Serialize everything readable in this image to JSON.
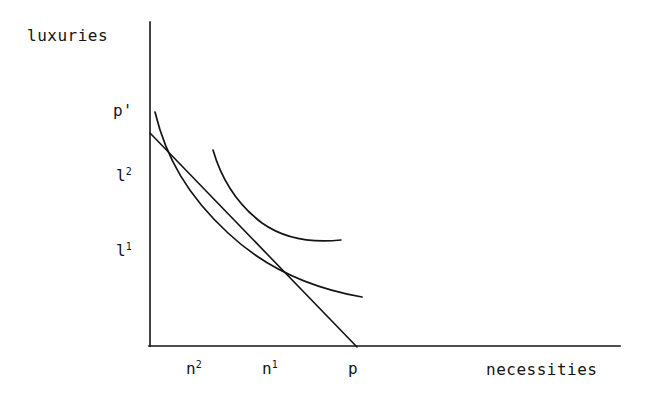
{
  "figure": {
    "title": "",
    "background_color": "#ffffff",
    "ink_color": "#141414"
  },
  "axes": {
    "y_axis_title": "luxuries",
    "x_axis_title": "necessities",
    "origin": {
      "x": 150,
      "y": 346
    },
    "y_axis_top": {
      "x": 150,
      "y": 22
    },
    "x_axis_right": {
      "x": 620,
      "y": 346
    }
  },
  "tick_labels": {
    "y": [
      {
        "name": "p-prime",
        "text": "p'",
        "x": 113,
        "y": 101
      },
      {
        "name": "l2",
        "base": "l",
        "sup": "2",
        "x": 116,
        "y": 166
      },
      {
        "name": "l1",
        "base": "l",
        "sup": "1",
        "x": 116,
        "y": 241
      }
    ],
    "x": [
      {
        "name": "n2",
        "base": "n",
        "sup": "2",
        "x": 186,
        "y": 359
      },
      {
        "name": "n1",
        "base": "n",
        "sup": "1",
        "x": 262,
        "y": 359
      },
      {
        "name": "p",
        "text": "p",
        "x": 348,
        "y": 359
      }
    ]
  },
  "chart_data": {
    "type": "line",
    "title": "",
    "xlabel": "necessities",
    "ylabel": "luxuries",
    "grid": false,
    "legend": "none",
    "xlim": [
      0,
      1
    ],
    "ylim": [
      0,
      1
    ],
    "annotations": [
      {
        "label": "p'",
        "meaning": "budget-line y-intercept",
        "axis": "y"
      },
      {
        "label": "l2",
        "meaning": "luxuries consumed at bundle 2",
        "axis": "y"
      },
      {
        "label": "l1",
        "meaning": "luxuries consumed at bundle 1",
        "axis": "y"
      },
      {
        "label": "n2",
        "meaning": "necessities consumed at bundle 2",
        "axis": "x"
      },
      {
        "label": "n1",
        "meaning": "necessities consumed at bundle 1",
        "axis": "x"
      },
      {
        "label": "p",
        "meaning": "budget-line x-intercept",
        "axis": "x"
      }
    ],
    "series": [
      {
        "name": "budget-line",
        "kind": "straight-line",
        "path": "M 150 133 L 357 347"
      },
      {
        "name": "indifference-curve-upper",
        "kind": "convex-curve",
        "path": "M 155 112 C 166 158 188 196 228 233 C 262 265 305 287 362 297"
      },
      {
        "name": "indifference-curve-lower",
        "kind": "convex-curve",
        "path": "M 213 150 C 222 181 238 205 262 223 C 286 240 313 243 341 240"
      }
    ],
    "tangency_points": [
      {
        "name": "bundle-2",
        "x": 201,
        "y": 186
      },
      {
        "name": "bundle-1",
        "x": 283,
        "y": 268
      }
    ]
  }
}
